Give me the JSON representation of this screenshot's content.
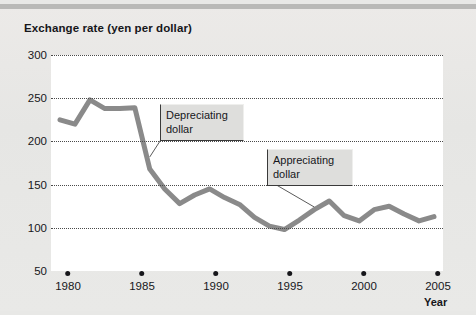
{
  "chart_data": {
    "type": "line",
    "title": "Exchange rate (yen per dollar)",
    "xlabel": "Year",
    "ylabel": "Exchange rate (yen per dollar)",
    "xlim": [
      1980,
      2005
    ],
    "ylim": [
      50,
      300
    ],
    "yticks": [
      300,
      250,
      200,
      150,
      100,
      50
    ],
    "xticks": [
      1980,
      1985,
      1990,
      1995,
      2000,
      2005
    ],
    "grid": "horizontal-dotted",
    "legend": "none",
    "line_color": "#8a8a8a",
    "x": [
      1980,
      1981,
      1982,
      1983,
      1984,
      1985,
      1986,
      1987,
      1988,
      1989,
      1990,
      1991,
      1992,
      1993,
      1994,
      1995,
      1996,
      1997,
      1998,
      1999,
      2000,
      2001,
      2002,
      2003,
      2004,
      2005
    ],
    "values": [
      225,
      220,
      248,
      238,
      238,
      239,
      168,
      145,
      128,
      138,
      145,
      135,
      127,
      112,
      102,
      98,
      109,
      121,
      131,
      114,
      108,
      121,
      125,
      116,
      108,
      113
    ],
    "annotations": [
      {
        "label": "Depreciating dollar",
        "points_to_year": 1986,
        "points_to_value": 182
      },
      {
        "label": "Appreciating dollar",
        "points_to_year": 1997,
        "points_to_value": 124
      }
    ]
  },
  "yticks": [
    {
      "label": "300"
    },
    {
      "label": "250"
    },
    {
      "label": "200"
    },
    {
      "label": "150"
    },
    {
      "label": "100"
    },
    {
      "label": "50"
    }
  ],
  "xticks": [
    {
      "label": "1980"
    },
    {
      "label": "1985"
    },
    {
      "label": "1990"
    },
    {
      "label": "1995"
    },
    {
      "label": "2000"
    },
    {
      "label": "2005"
    }
  ],
  "title": "Exchange rate (yen per dollar)",
  "axis_title_x": "Year",
  "callouts": {
    "depreciating": "Depreciating dollar",
    "appreciating": "Appreciating dollar"
  },
  "colors": {
    "line": "#8a8a8a",
    "grid": "#4a4a4a",
    "text": "#17171b",
    "plot_bg": "#ffffff",
    "page_bg": "#e8e8e6"
  }
}
